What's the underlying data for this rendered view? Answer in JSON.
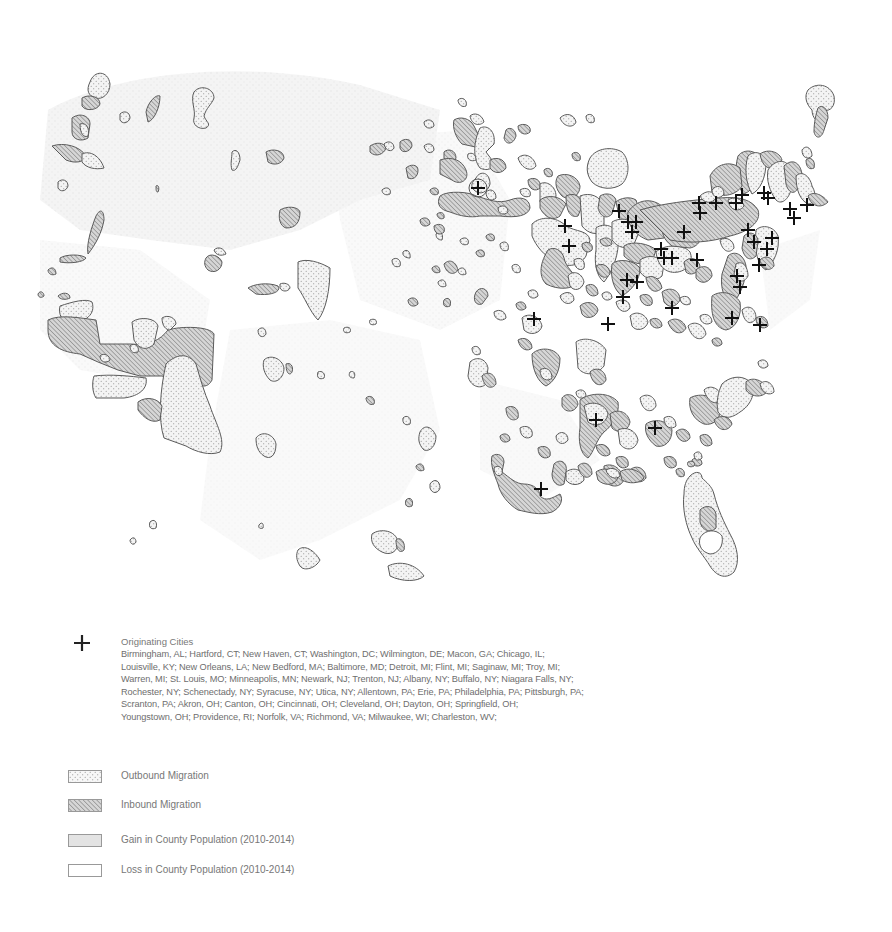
{
  "map": {
    "type": "thematic-choropleth-overlay",
    "region": "Contiguous United States",
    "colors": {
      "background": "#ffffff",
      "county_gain_fill": "#e6e6e6",
      "outbound_fill": "#f4f4f4",
      "outbound_dot": "#8a8a8a",
      "inbound_fill": "#d0d0d0",
      "inbound_hatch": "#6f6f6f",
      "outline": "#5a5a5a",
      "city_marker": "#111111"
    }
  },
  "legend": {
    "cities": {
      "icon": "plus-icon",
      "title": "Originating Cities",
      "lines": [
        "Birmingham, AL; Hartford, CT; New Haven, CT; Washington, DC; Wilmington, DE; Macon, GA; Chicago, IL;",
        "Louisville, KY; New Orleans, LA; New Bedford, MA; Baltimore, MD; Detroit, MI; Flint, MI; Saginaw, MI; Troy, MI;",
        "Warren, MI; St. Louis, MO; Minneapolis, MN; Newark, NJ; Trenton, NJ; Albany, NY; Buffalo, NY; Niagara Falls, NY;",
        "Rochester, NY; Schenectady, NY; Syracuse, NY; Utica, NY; Allentown, PA; Erie, PA; Philadelphia, PA; Pittsburgh, PA;",
        "Scranton, PA; Akron, OH; Canton, OH; Cincinnati, OH; Cleveland, OH; Dayton, OH; Springfield, OH;",
        "Youngstown, OH; Providence, RI; Norfolk, VA; Richmond, VA; Milwaukee, WI; Charleston, WV;"
      ]
    },
    "items": [
      {
        "pattern": "dots",
        "label": "Outbound Migration"
      },
      {
        "pattern": "hatch",
        "label": "Inbound Migration"
      },
      {
        "pattern": "gray",
        "label": "Gain in County Population (2010-2014)"
      },
      {
        "pattern": "empty",
        "label": "Loss in County Population (2010-2014)"
      }
    ]
  }
}
